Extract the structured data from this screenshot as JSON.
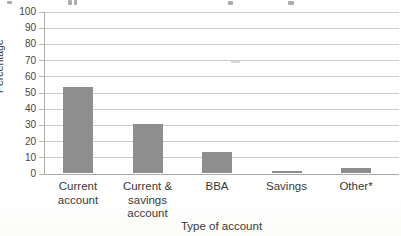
{
  "chart_data": {
    "type": "bar",
    "categories": [
      "Current account",
      "Current & savings account",
      "BBA",
      "Savings",
      "Other*"
    ],
    "categories_display": [
      [
        "Current",
        "account"
      ],
      [
        "Current &",
        "savings",
        "account"
      ],
      [
        "BBA"
      ],
      [
        "Savings"
      ],
      [
        "Other*"
      ]
    ],
    "values": [
      53,
      30,
      13,
      1,
      3
    ],
    "title": "",
    "xlabel": "Type of account",
    "ylabel": "Percentage",
    "ylim": [
      0,
      100
    ],
    "ytick_step": 10,
    "ytick_labels": [
      "0",
      "10",
      "20",
      "30",
      "40",
      "50",
      "60",
      "70",
      "80",
      "90",
      "100"
    ],
    "grid": true,
    "legend": "none",
    "bar_color": "#8e8e8e"
  },
  "colors": {
    "bar": "#8e8e8e",
    "gridline": "#cccccb",
    "axis": "#aeaeac",
    "text": "#3d3d3d",
    "background": "#ffffff"
  }
}
